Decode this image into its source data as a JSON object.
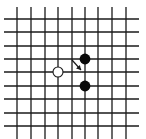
{
  "diagram": {
    "type": "go-board-fragment",
    "colors": {
      "background": "#ffffff",
      "grid": "#1a1a1a",
      "black_stone": "#0a0a0a",
      "white_stone_fill": "#ffffff",
      "white_stone_stroke": "#1a1a1a",
      "arrow": "#1a1a1a"
    },
    "grid": {
      "columns_x": [
        17,
        31,
        45,
        58,
        72,
        85,
        98,
        112,
        126
      ],
      "rows_y": [
        19,
        32,
        46,
        59,
        72,
        86,
        99,
        113,
        126
      ],
      "h_line_extent": [
        4,
        139
      ],
      "v_line_extent": [
        7,
        139
      ]
    },
    "stones": [
      {
        "color": "black",
        "col": 5,
        "row": 3
      },
      {
        "color": "black",
        "col": 5,
        "row": 5
      },
      {
        "color": "white",
        "col": 3,
        "row": 4
      }
    ],
    "arrows": [
      {
        "from": [
          72,
          60
        ],
        "to": [
          81,
          70
        ],
        "direction": "down-right"
      }
    ]
  }
}
